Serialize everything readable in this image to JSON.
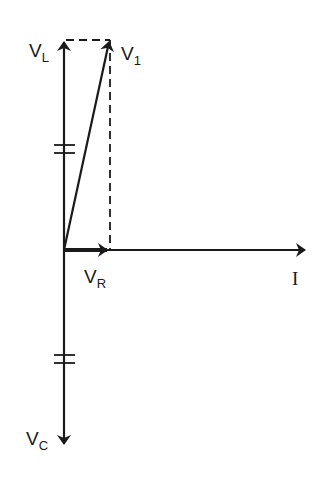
{
  "diagram": {
    "type": "phasor-diagram",
    "colors": {
      "stroke": "#1a1a1a",
      "background": "#ffffff"
    },
    "origin": {
      "x": 64,
      "y": 250
    },
    "phasors": [
      {
        "id": "VL",
        "label_main": "V",
        "label_sub": "L",
        "direction": "up",
        "style": "solid-arrow"
      },
      {
        "id": "V1",
        "label_main": "V",
        "label_sub": "1",
        "direction": "up-right",
        "style": "solid-arrow"
      },
      {
        "id": "VR",
        "label_main": "V",
        "label_sub": "R",
        "direction": "right",
        "style": "thick-arrow"
      },
      {
        "id": "I",
        "label_main": "I",
        "label_sub": "",
        "direction": "right",
        "style": "solid-arrow"
      },
      {
        "id": "VC",
        "label_main": "V",
        "label_sub": "C",
        "direction": "down",
        "style": "solid-arrow"
      }
    ],
    "construction_lines": [
      {
        "from": "VL-tip",
        "to": "V1-tip",
        "style": "dashed"
      },
      {
        "from": "V1-tip",
        "to": "VR-tip",
        "style": "dashed"
      }
    ],
    "equal_magnitude_marks": [
      {
        "on": "VL",
        "count": 2
      },
      {
        "on": "VC",
        "count": 2
      }
    ]
  }
}
